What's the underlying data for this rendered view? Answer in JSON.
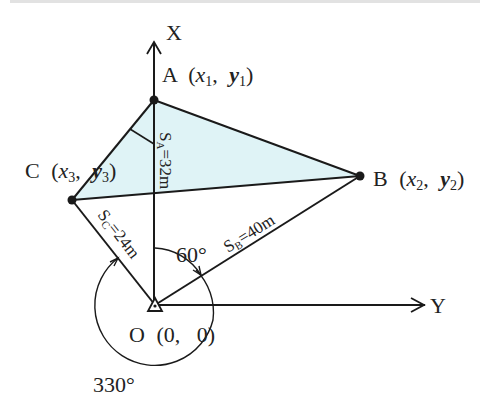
{
  "diagram": {
    "type": "survey-coordinate-diagram",
    "colors": {
      "line": "#1a1a1a",
      "fill": "#dff3f6",
      "point": "#1a1a1a",
      "text": "#222222"
    },
    "axes": {
      "x_axis_label": "X",
      "y_axis_label": "Y"
    },
    "origin": {
      "name": "O",
      "coords": "(0,   0)"
    },
    "points": [
      {
        "id": "A",
        "name": "A",
        "coords_open": "(",
        "var_x": "x",
        "sub_x": "1",
        "comma": ",",
        "var_y": "y",
        "sub_y": "1",
        "coords_close": ")"
      },
      {
        "id": "B",
        "name": "B",
        "coords_open": "(",
        "var_x": "x",
        "sub_x": "2",
        "comma": ",",
        "var_y": "y",
        "sub_y": "2",
        "coords_close": ")"
      },
      {
        "id": "C",
        "name": "C",
        "coords_open": "(",
        "var_x": "x",
        "sub_x": "3",
        "comma": ",",
        "var_y": "y",
        "sub_y": "3",
        "coords_close": ")"
      }
    ],
    "distances": {
      "SA": {
        "s": "S",
        "sub": "A",
        "value": "=32m"
      },
      "SB": {
        "s": "S",
        "sub": "B",
        "value": "=40m"
      },
      "SC": {
        "s": "S",
        "sub": "C",
        "value": "=24m"
      }
    },
    "angles": {
      "to_B": "60°",
      "to_C": "330°"
    },
    "top_text_fragment": "（partially cropped text line at top edge）"
  }
}
